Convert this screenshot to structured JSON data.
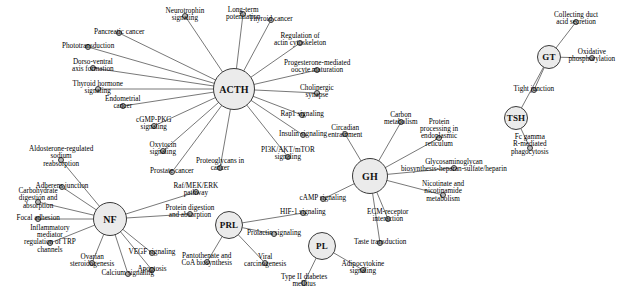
{
  "diagram": {
    "background_color": "#ffffff",
    "hub_fill": "#ebebeb",
    "leaf_fill": "#b9b9b9",
    "stroke_color": "#3a3a3a",
    "edge_color": "#555555",
    "hubs": [
      {
        "id": "ACTH",
        "label": "ACTH",
        "x": 234,
        "y": 89,
        "r": 21,
        "font_size": 10
      },
      {
        "id": "NF",
        "label": "NF",
        "x": 110,
        "y": 219,
        "r": 17,
        "font_size": 10
      },
      {
        "id": "PRL",
        "label": "PRL",
        "x": 229,
        "y": 225,
        "r": 14,
        "font_size": 9
      },
      {
        "id": "GH",
        "label": "GH",
        "x": 370,
        "y": 176,
        "r": 18,
        "font_size": 10
      },
      {
        "id": "PL",
        "label": "PL",
        "x": 322,
        "y": 246,
        "r": 14,
        "font_size": 9
      },
      {
        "id": "GT",
        "label": "GT",
        "x": 549,
        "y": 57,
        "r": 12,
        "font_size": 9
      },
      {
        "id": "TSH",
        "label": "TSH",
        "x": 516,
        "y": 118,
        "r": 12,
        "font_size": 9
      }
    ],
    "leaves": [
      {
        "id": "L01",
        "label": "Neurotrophin\nsignaling",
        "hub": "ACTH",
        "dx": 185,
        "dy": 16,
        "tx": 185,
        "ty": 15,
        "font_size": 7.2,
        "anchor": "center"
      },
      {
        "id": "L02",
        "label": "Long-term\npotentiation",
        "hub": "ACTH",
        "dx": 243,
        "dy": 14,
        "tx": 243,
        "ty": 14,
        "font_size": 7.2,
        "anchor": "center"
      },
      {
        "id": "L03",
        "label": "Thyroid cancer",
        "hub": "ACTH",
        "dx": 271,
        "dy": 20,
        "tx": 271,
        "ty": 19,
        "font_size": 7.2,
        "anchor": "center"
      },
      {
        "id": "L04",
        "label": "Regulation of\nactin cytoskeleton",
        "hub": "ACTH",
        "dx": 300,
        "dy": 43,
        "tx": 300,
        "ty": 40,
        "font_size": 7.2,
        "anchor": "center"
      },
      {
        "id": "L05",
        "label": "Progesterone-mediated\noocyte maturation",
        "hub": "ACTH",
        "dx": 317,
        "dy": 70,
        "tx": 317,
        "ty": 67,
        "font_size": 7.2,
        "anchor": "center"
      },
      {
        "id": "L06",
        "label": "Cholinergic\nsynapse",
        "hub": "ACTH",
        "dx": 317,
        "dy": 93,
        "tx": 317,
        "ty": 92,
        "font_size": 7.2,
        "anchor": "center"
      },
      {
        "id": "L07",
        "label": "Rap1 signaling",
        "hub": "ACTH",
        "dx": 302,
        "dy": 115,
        "tx": 302,
        "ty": 114,
        "font_size": 7.2,
        "anchor": "center"
      },
      {
        "id": "L08",
        "label": "Insulin signaling",
        "hub": "ACTH",
        "dx": 303,
        "dy": 135,
        "tx": 303,
        "ty": 134,
        "font_size": 7.2,
        "anchor": "center"
      },
      {
        "id": "L09",
        "label": "PI3K/AKT/mTOR\nsignaling",
        "hub": "ACTH",
        "dx": 288,
        "dy": 157,
        "tx": 288,
        "ty": 154,
        "font_size": 7.2,
        "anchor": "center"
      },
      {
        "id": "L10",
        "label": "Proteoglycans in\ncancer",
        "hub": "ACTH",
        "dx": 220,
        "dy": 168,
        "tx": 220,
        "ty": 165,
        "font_size": 7.2,
        "anchor": "center"
      },
      {
        "id": "L11",
        "label": "Prostate cancer",
        "hub": "ACTH",
        "dx": 172,
        "dy": 172,
        "tx": 172,
        "ty": 171,
        "font_size": 7.2,
        "anchor": "center"
      },
      {
        "id": "L12",
        "label": "Oxytocin\nsignaling",
        "hub": "ACTH",
        "dx": 163,
        "dy": 151,
        "tx": 163,
        "ty": 149,
        "font_size": 7.2,
        "anchor": "center"
      },
      {
        "id": "L13",
        "label": "cGMP-PKG\nsignaling",
        "hub": "ACTH",
        "dx": 154,
        "dy": 126,
        "tx": 154,
        "ty": 124,
        "font_size": 7.2,
        "anchor": "center"
      },
      {
        "id": "L14",
        "label": "Endometrial\ncancer",
        "hub": "ACTH",
        "dx": 123,
        "dy": 106,
        "tx": 123,
        "ty": 103,
        "font_size": 7.2,
        "anchor": "center"
      },
      {
        "id": "L15",
        "label": "Thyroid hormone\nsignaling",
        "hub": "ACTH",
        "dx": 98,
        "dy": 89,
        "tx": 98,
        "ty": 88,
        "font_size": 7.2,
        "anchor": "center"
      },
      {
        "id": "L16",
        "label": "Dorso-ventral\naxis formation",
        "hub": "ACTH",
        "dx": 93,
        "dy": 68,
        "tx": 93,
        "ty": 66,
        "font_size": 7.2,
        "anchor": "center"
      },
      {
        "id": "L17",
        "label": "Phototransduction",
        "hub": "ACTH",
        "dx": 88,
        "dy": 47,
        "tx": 88,
        "ty": 46,
        "font_size": 7.2,
        "anchor": "center"
      },
      {
        "id": "L18",
        "label": "Pancreatic cancer",
        "hub": "ACTH",
        "dx": 119,
        "dy": 33,
        "tx": 119,
        "ty": 32,
        "font_size": 7.2,
        "anchor": "center"
      },
      {
        "id": "N01",
        "label": "Aldosterone-regulated\nsodium\nreabsorption",
        "hub": "NF",
        "dx": 61,
        "dy": 160,
        "tx": 61,
        "ty": 157,
        "font_size": 7.2,
        "anchor": "center"
      },
      {
        "id": "N02",
        "label": "Adherens junction",
        "hub": "NF",
        "dx": 62,
        "dy": 187,
        "tx": 62,
        "ty": 186,
        "font_size": 7.2,
        "anchor": "center"
      },
      {
        "id": "N03",
        "label": "Carbohydrate\ndigestion and\nabsorption",
        "hub": "NF",
        "dx": 38,
        "dy": 202,
        "tx": 38,
        "ty": 199,
        "font_size": 7.2,
        "anchor": "center"
      },
      {
        "id": "N04",
        "label": "Focal adhesion",
        "hub": "NF",
        "dx": 38,
        "dy": 219,
        "tx": 38,
        "ty": 218,
        "font_size": 7.2,
        "anchor": "center"
      },
      {
        "id": "N05",
        "label": "Inflammatory\nmediator\nregulation of TRP\nchannels",
        "hub": "NF",
        "dx": 50,
        "dy": 243,
        "tx": 50,
        "ty": 239,
        "font_size": 7.2,
        "anchor": "center"
      },
      {
        "id": "N06",
        "label": "Apoptosis",
        "hub": "NF",
        "dx": 152,
        "dy": 270,
        "tx": 152,
        "ty": 269,
        "font_size": 7.2,
        "anchor": "center"
      },
      {
        "id": "N07",
        "label": "Ovarian\nsteroidogenesis",
        "hub": "NF",
        "dx": 92,
        "dy": 263,
        "tx": 92,
        "ty": 261,
        "font_size": 7.2,
        "anchor": "center"
      },
      {
        "id": "N08",
        "label": "Calcium signaling",
        "hub": "NF",
        "dx": 128,
        "dy": 274,
        "tx": 128,
        "ty": 273,
        "font_size": 7.2,
        "anchor": "center"
      },
      {
        "id": "N09",
        "label": "VEGF signaling",
        "hub": "NF",
        "dx": 152,
        "dy": 253,
        "tx": 152,
        "ty": 252,
        "font_size": 7.2,
        "anchor": "center"
      },
      {
        "id": "N10",
        "label": "Protein digestion\nand absorption",
        "hub": "NF",
        "dx": 190,
        "dy": 214,
        "tx": 190,
        "ty": 212,
        "font_size": 7.2,
        "anchor": "center"
      },
      {
        "id": "N11",
        "label": "Raf/MEK/ERK\npathway",
        "hub": "NF",
        "dx": 196,
        "dy": 192,
        "tx": 196,
        "ty": 190,
        "font_size": 7.2,
        "anchor": "center"
      },
      {
        "id": "P01",
        "label": "Pantothenate and\nCoA biosynthesis",
        "hub": "PRL",
        "dx": 207,
        "dy": 262,
        "tx": 207,
        "ty": 260,
        "font_size": 7.2,
        "anchor": "center"
      },
      {
        "id": "P02",
        "label": "Viral\ncarcinogenesis",
        "hub": "PRL",
        "dx": 265,
        "dy": 263,
        "tx": 265,
        "ty": 261,
        "font_size": 7.2,
        "anchor": "center"
      },
      {
        "id": "P03",
        "label": "Prolactin signaling",
        "hub": "PRL",
        "dx": 274,
        "dy": 234,
        "tx": 274,
        "ty": 233,
        "font_size": 7.2,
        "anchor": "center"
      },
      {
        "id": "P04",
        "label": "HIF-1 signaling",
        "hub": "PRL",
        "dx": 303,
        "dy": 213,
        "tx": 303,
        "ty": 212,
        "font_size": 7.2,
        "anchor": "center"
      },
      {
        "id": "G01",
        "label": "Carbon\nmetabolism",
        "hub": "GH",
        "dx": 401,
        "dy": 122,
        "tx": 401,
        "ty": 119,
        "font_size": 7.2,
        "anchor": "center"
      },
      {
        "id": "G02",
        "label": "Protein\nprocessing in\nendoplasmic\nreticulum",
        "hub": "GH",
        "dx": 439,
        "dy": 138,
        "tx": 439,
        "ty": 133,
        "font_size": 7.2,
        "anchor": "center"
      },
      {
        "id": "G03",
        "label": "Glycosaminoglycan\nbiosynthesis-heparan-sulfate/heparin",
        "hub": "GH",
        "dx": 454,
        "dy": 168,
        "tx": 454,
        "ty": 166,
        "font_size": 7.2,
        "anchor": "center"
      },
      {
        "id": "G04",
        "label": "Nicotinate and\nnicotinamide\nmetabolism",
        "hub": "GH",
        "dx": 443,
        "dy": 195,
        "tx": 443,
        "ty": 192,
        "font_size": 7.2,
        "anchor": "center"
      },
      {
        "id": "G05",
        "label": "ECM-receptor\ninteraction",
        "hub": "GH",
        "dx": 388,
        "dy": 219,
        "tx": 388,
        "ty": 216,
        "font_size": 7.2,
        "anchor": "center"
      },
      {
        "id": "G06",
        "label": "Taste transduction",
        "hub": "GH",
        "dx": 380,
        "dy": 243,
        "tx": 380,
        "ty": 242,
        "font_size": 7.2,
        "anchor": "center"
      },
      {
        "id": "G07",
        "label": "cAMP signaling",
        "hub": "GH",
        "dx": 323,
        "dy": 199,
        "tx": 323,
        "ty": 198,
        "font_size": 7.2,
        "anchor": "center"
      },
      {
        "id": "G08",
        "label": "Circadian\nentrainment",
        "hub": "GH",
        "dx": 345,
        "dy": 134,
        "tx": 345,
        "ty": 132,
        "font_size": 7.2,
        "anchor": "center"
      },
      {
        "id": "PL01",
        "label": "Type II diabetes\nmellitus",
        "hub": "PL",
        "dx": 304,
        "dy": 283,
        "tx": 304,
        "ty": 281,
        "font_size": 7.2,
        "anchor": "center"
      },
      {
        "id": "PL02",
        "label": "Adipocytokine\nsignaling",
        "hub": "PL",
        "dx": 363,
        "dy": 270,
        "tx": 363,
        "ty": 268,
        "font_size": 7.2,
        "anchor": "center"
      },
      {
        "id": "GT01",
        "label": "Collecting duct\nacid secretion",
        "hub": "GT",
        "dx": 576,
        "dy": 22,
        "tx": 576,
        "ty": 19,
        "font_size": 7.2,
        "anchor": "center"
      },
      {
        "id": "GT02",
        "label": "Oxidative\nphosphorylation",
        "hub": "GT",
        "dx": 592,
        "dy": 58,
        "tx": 592,
        "ty": 56,
        "font_size": 7.2,
        "anchor": "center"
      },
      {
        "id": "GT03",
        "label": "Tight junction",
        "hub": "GT",
        "dx": 534,
        "dy": 90,
        "tx": 534,
        "ty": 89,
        "font_size": 7.2,
        "anchor": "center"
      },
      {
        "id": "TS01",
        "label": "Fc gamma\nR-mediated\nphagocytosis",
        "hub": "TSH",
        "dx": 530,
        "dy": 148,
        "tx": 530,
        "ty": 145,
        "font_size": 7.2,
        "anchor": "center"
      }
    ],
    "extra_edges": [
      {
        "from": "GT",
        "to": "TSH"
      }
    ]
  }
}
